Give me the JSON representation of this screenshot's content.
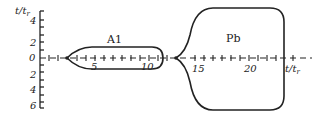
{
  "diagram": {
    "y_axis": {
      "label": "t/t",
      "label_sub": "r",
      "ticks": [
        "4",
        "2",
        "0",
        "2",
        "4",
        "6"
      ]
    },
    "x_axis": {
      "label": "t/t",
      "label_sub": "r",
      "ticks": [
        "5",
        "10",
        "15",
        "20"
      ]
    },
    "regions": [
      {
        "name": "A1"
      },
      {
        "name": "Pb"
      }
    ],
    "colors": {
      "ink": "#222222",
      "background": "#ffffff"
    }
  }
}
